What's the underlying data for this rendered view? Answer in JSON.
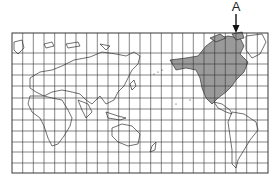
{
  "map": {
    "projection": "world-grid-pacific-centered",
    "grid": {
      "columns": 24,
      "rows": 13,
      "line_color": "#333333"
    },
    "highlight": {
      "region": "North America (Canada, United States)",
      "fill": "#9a9a9a"
    },
    "land_fill": "#ffffff",
    "border_color": "#222222"
  },
  "annotation": {
    "label": "A",
    "arrow": "down-arrow"
  }
}
